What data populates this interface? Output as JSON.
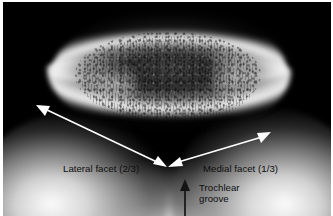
{
  "figure": {
    "kind": "radiograph",
    "modality": "x-ray",
    "view": "patellar skyline (sunrise) view of the knee",
    "border_color": "#ffffff",
    "film_background_color": "#000000"
  },
  "anatomy": [
    {
      "id": "patella",
      "name": "Patella",
      "region": "superior bone silhouette"
    },
    {
      "id": "lateral-femoral-condyle",
      "name": "Lateral femoral condyle",
      "region": "lower left dome"
    },
    {
      "id": "medial-femoral-condyle",
      "name": "Medial femoral condyle",
      "region": "lower right dome"
    },
    {
      "id": "trochlear-sulcus",
      "name": "Trochlear sulcus",
      "region": "central notch between condyles"
    }
  ],
  "annotations": {
    "labels": [
      {
        "id": "lateral-facet",
        "text": "Lateral facet (2/3)",
        "color": "#0d0d0d",
        "x": 60,
        "y": 161
      },
      {
        "id": "medial-facet",
        "text": "Medial facet (1/3)",
        "color": "#0d0d0d",
        "x": 200,
        "y": 161
      },
      {
        "id": "trochlear-groove",
        "text": "Trochlear groove",
        "line_1": "Trochlear",
        "line_2": "groove",
        "color": "#0d0d0d",
        "x": 196,
        "y": 180
      }
    ],
    "arrows": [
      {
        "id": "lateral-facet-arrow",
        "style": "double-headed",
        "color": "#ffffff",
        "from_x": 37,
        "from_y": 106,
        "to_x": 163,
        "to_y": 166
      },
      {
        "id": "medial-facet-arrow",
        "style": "double-headed",
        "color": "#ffffff",
        "from_x": 169,
        "from_y": 166,
        "to_x": 268,
        "to_y": 134
      },
      {
        "id": "trochlear-groove-arrow",
        "style": "single-headed",
        "color": "#111111",
        "from_x": 185,
        "from_y": 216,
        "to_x": 185,
        "to_y": 180
      }
    ]
  }
}
